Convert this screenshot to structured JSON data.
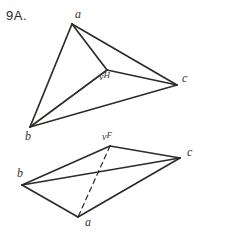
{
  "page": {
    "width": 244,
    "height": 236,
    "background_color": "#ffffff",
    "ink_color": "#2e2b28",
    "problem_number": "9A."
  },
  "figures": [
    {
      "id": "top-figure",
      "name": "horizontal-projection-triangle",
      "description": "Triangle a-b-c with interior point H joined to all three vertices",
      "points": {
        "a": {
          "x": 72,
          "y": 24,
          "label": "a",
          "label_x": 75,
          "label_y": 8
        },
        "b": {
          "x": 30,
          "y": 127,
          "label": "b",
          "label_x": 25,
          "label_y": 130
        },
        "c": {
          "x": 177,
          "y": 85,
          "label": "c",
          "label_x": 182,
          "label_y": 72
        },
        "h": {
          "x": 107,
          "y": 70,
          "label_prefix": "v",
          "label_sup": "H",
          "label_x": 99,
          "label_y": 71
        }
      },
      "solid_edges": [
        [
          "a",
          "b"
        ],
        [
          "b",
          "c"
        ],
        [
          "a",
          "c"
        ],
        [
          "a",
          "h"
        ],
        [
          "b",
          "h"
        ],
        [
          "c",
          "h"
        ]
      ],
      "dashed_edges": []
    },
    {
      "id": "bottom-figure",
      "name": "frontal-projection-quadrilateral",
      "description": "Quadrilateral b-F-c-a with solid diagonal b-c and dashed diagonal F-a",
      "points": {
        "f": {
          "x": 110,
          "y": 146,
          "label_prefix": "v",
          "label_sup": "F",
          "label_x": 102,
          "label_y": 131
        },
        "c": {
          "x": 180,
          "y": 158,
          "label": "c",
          "label_x": 187,
          "label_y": 146
        },
        "b": {
          "x": 22,
          "y": 185,
          "label": "b",
          "label_x": 17,
          "label_y": 167
        },
        "a": {
          "x": 78,
          "y": 217,
          "label": "a",
          "label_x": 85,
          "label_y": 216
        }
      },
      "solid_edges": [
        [
          "b",
          "f"
        ],
        [
          "f",
          "c"
        ],
        [
          "c",
          "a"
        ],
        [
          "a",
          "b"
        ],
        [
          "b",
          "c"
        ]
      ],
      "dashed_edges": [
        [
          "f",
          "a"
        ]
      ]
    }
  ],
  "labels": {
    "top_a": "a",
    "top_b": "b",
    "top_c": "c",
    "top_h_prefix": "v",
    "top_h_sup": "H",
    "bottom_a": "a",
    "bottom_b": "b",
    "bottom_c": "c",
    "bottom_f_prefix": "v",
    "bottom_f_sup": "F"
  }
}
